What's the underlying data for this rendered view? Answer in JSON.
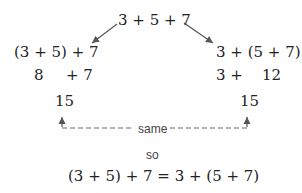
{
  "top_expression": "3 + 5 + 7",
  "left": {
    "grouping": "(3 + 5) + 7",
    "partial_a": "8",
    "partial_b": "+ 7",
    "result": "15"
  },
  "right": {
    "grouping": "3 + (5 + 7)",
    "partial_a": "3 +",
    "partial_b": "12",
    "result": "15"
  },
  "connector_label": "same",
  "conclusion_word": "so",
  "conclusion": "(3 + 5) + 7 = 3 + (5 + 7)"
}
